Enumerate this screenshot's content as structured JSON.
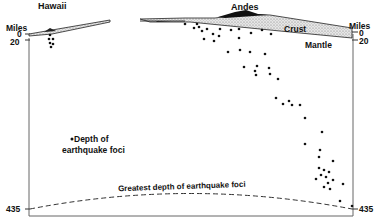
{
  "labels": {
    "hawaii": "Hawaii",
    "andes": "Andes",
    "crust": "Crust",
    "mantle": "Mantle",
    "left_axis_title": "Miles",
    "right_axis_title": "Miles",
    "left_tick_0": "0",
    "left_tick_20": "20",
    "left_tick_435": "435",
    "right_tick_0": "0",
    "right_tick_20": "20",
    "right_tick_435": "435",
    "legend_line1": "Depth of",
    "legend_line2": "earthquake foci",
    "greatest_depth": "Greatest depth of earthquake foci"
  },
  "colors": {
    "ink": "#111111",
    "frame": "#555555",
    "crust_fill": "#d8d8d8",
    "background": "#ffffff"
  },
  "depth_axis": {
    "unit": "Miles",
    "ticks": [
      0,
      20,
      435
    ]
  },
  "foci_groups": [
    {
      "region": "Hawaii",
      "count": 6
    },
    {
      "region": "Andes",
      "count": 55
    }
  ]
}
